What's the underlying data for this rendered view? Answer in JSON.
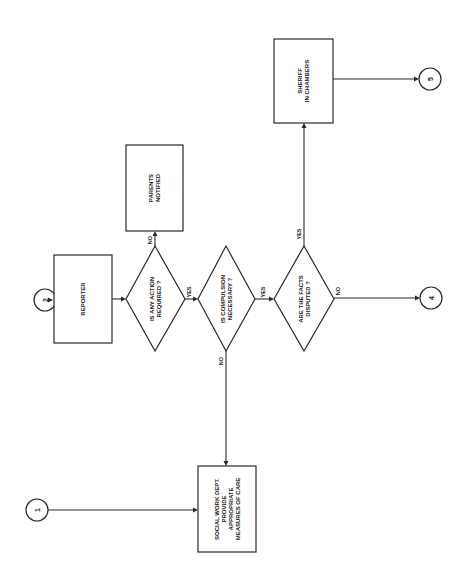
{
  "diagram": {
    "type": "flowchart",
    "orientation": "rotated-90-ccw",
    "connectors": {
      "c1": {
        "label": "1"
      },
      "c2": {
        "label": "2"
      },
      "c4": {
        "label": "4"
      },
      "c5": {
        "label": "5"
      }
    },
    "nodes": {
      "reporter": {
        "line1": "REPORTER"
      },
      "action_required": {
        "line1": "IS ANY ACTION",
        "line2": "REQUIRED ?"
      },
      "parents_notified": {
        "line1": "PARENTS",
        "line2": "NOTIFIED"
      },
      "compulsion_necessary": {
        "line1": "IS COMPULSION",
        "line2": "NECESSARY ?"
      },
      "facts_disputed": {
        "line1": "ARE THE FACTS",
        "line2": "DISPUTED ?"
      },
      "sheriff": {
        "line1": "SHERIFF",
        "line2": "IN CHAMBERS"
      },
      "social_work": {
        "line1": "SOCIAL WORK DEPT.",
        "line2": "PROVIDE",
        "line3": "APPROPRIATE",
        "line4": "MEASURES OF CARE"
      }
    },
    "edge_labels": {
      "action_no": "NO",
      "action_yes": "YES",
      "compulsion_yes": "YES",
      "compulsion_no": "NO",
      "facts_yes": "YES",
      "facts_no": "NO"
    },
    "edges": [
      {
        "from": "c2",
        "to": "reporter"
      },
      {
        "from": "reporter",
        "to": "action_required"
      },
      {
        "from": "action_required",
        "to": "parents_notified",
        "label": "NO"
      },
      {
        "from": "action_required",
        "to": "compulsion_necessary",
        "label": "YES"
      },
      {
        "from": "compulsion_necessary",
        "to": "facts_disputed",
        "label": "YES"
      },
      {
        "from": "compulsion_necessary",
        "to": "social_work",
        "label": "NO"
      },
      {
        "from": "facts_disputed",
        "to": "sheriff",
        "label": "YES"
      },
      {
        "from": "facts_disputed",
        "to": "c4",
        "label": "NO"
      },
      {
        "from": "sheriff",
        "to": "c5"
      },
      {
        "from": "c1",
        "to": "social_work"
      }
    ]
  }
}
